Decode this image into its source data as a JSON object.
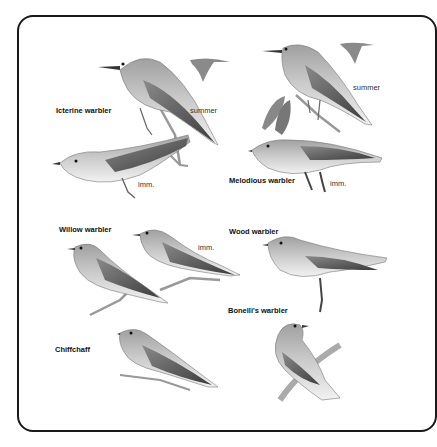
{
  "plate": {
    "species": [
      {
        "id": "icterine",
        "label": "Icterine warbler",
        "notes": [
          "summer",
          "imm."
        ]
      },
      {
        "id": "melodious",
        "label": "Melodious warbler",
        "notes": [
          "summer",
          "imm."
        ]
      },
      {
        "id": "willow",
        "label": "Willow warbler",
        "notes": [
          "imm."
        ]
      },
      {
        "id": "wood",
        "label": "Wood warbler",
        "notes": []
      },
      {
        "id": "bonelli",
        "label": "Bonelli's warbler",
        "notes": []
      },
      {
        "id": "chiffchaff",
        "label": "Chiffchaff",
        "notes": []
      }
    ]
  },
  "colors": {
    "frame": "#1a1a1a",
    "bird_upper": "#9a9a9a",
    "bird_wing": "#6e6e6e",
    "bird_under": "#efefef",
    "branch": "#8a8a8a"
  }
}
